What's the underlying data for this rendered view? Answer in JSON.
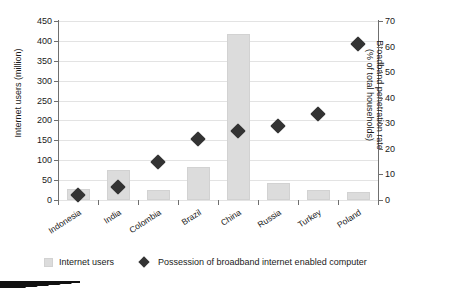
{
  "chart_data": {
    "type": "bar",
    "title": "",
    "subtitle": "",
    "xlabel": "",
    "ylabel": "Internet users (million)",
    "y2label_line1": "Broadband penetration rate",
    "y2label_line2": "(% of total households)",
    "grid": true,
    "legend_position": "bottom",
    "ylim": [
      0,
      450
    ],
    "y2lim": [
      0,
      70
    ],
    "yticks": [
      0,
      50,
      100,
      150,
      200,
      250,
      300,
      350,
      400,
      450
    ],
    "y2ticks": [
      0,
      10,
      20,
      30,
      40,
      50,
      60,
      70
    ],
    "categories": [
      "Indonesia",
      "India",
      "Colombia",
      "Brazil",
      "China",
      "Russia",
      "Turkey",
      "Poland"
    ],
    "series": [
      {
        "name": "Internet users",
        "type": "bar",
        "axis": "left",
        "unit": "million",
        "color": "#dcdcdc",
        "values": [
          27,
          76,
          24,
          82,
          417,
          43,
          26,
          19
        ]
      },
      {
        "name": "Possession of broadband internet enabled computer",
        "type": "scatter",
        "marker": "diamond",
        "axis": "right",
        "unit": "% of total households",
        "color": "#333333",
        "values": [
          2,
          5,
          15,
          24,
          27,
          29,
          33.5,
          61
        ]
      }
    ]
  },
  "legend": {
    "items": [
      {
        "label": "Internet users",
        "icon": "bar-swatch"
      },
      {
        "label": "Possession of broadband internet enabled computer",
        "icon": "diamond-marker"
      }
    ]
  }
}
